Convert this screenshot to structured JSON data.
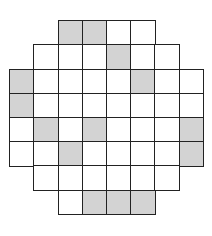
{
  "grid": {
    "origin_x": 10,
    "origin_y": 21,
    "cell_size": 24.2,
    "colors": {
      "filled": "#d3d3d3",
      "empty": "#ffffff",
      "line": "#222222"
    },
    "rows": [
      {
        "cols": [
          2,
          5
        ],
        "shaded": [
          2,
          3
        ]
      },
      {
        "cols": [
          1,
          6
        ],
        "shaded": [
          4
        ]
      },
      {
        "cols": [
          0,
          7
        ],
        "shaded": [
          0,
          5
        ]
      },
      {
        "cols": [
          0,
          7
        ],
        "shaded": [
          0
        ]
      },
      {
        "cols": [
          0,
          7
        ],
        "shaded": [
          1,
          3,
          7
        ]
      },
      {
        "cols": [
          0,
          7
        ],
        "shaded": [
          2,
          7
        ]
      },
      {
        "cols": [
          1,
          6
        ],
        "shaded": []
      },
      {
        "cols": [
          2,
          5
        ],
        "shaded": [
          3,
          4,
          5
        ]
      }
    ]
  }
}
